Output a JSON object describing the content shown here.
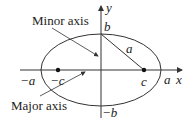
{
  "diagram": {
    "labels": {
      "minor_axis": "Minor axis",
      "major_axis": "Major axis",
      "y_axis": "y",
      "x_axis": "x",
      "top_vertex": "b",
      "bottom_vertex": "−b",
      "left_vertex": "−a",
      "right_vertex": "a",
      "left_focus": "−c",
      "right_focus": "c",
      "focal_distance": "a"
    },
    "colors": {
      "stroke": "#333333",
      "text": "#222222"
    }
  }
}
